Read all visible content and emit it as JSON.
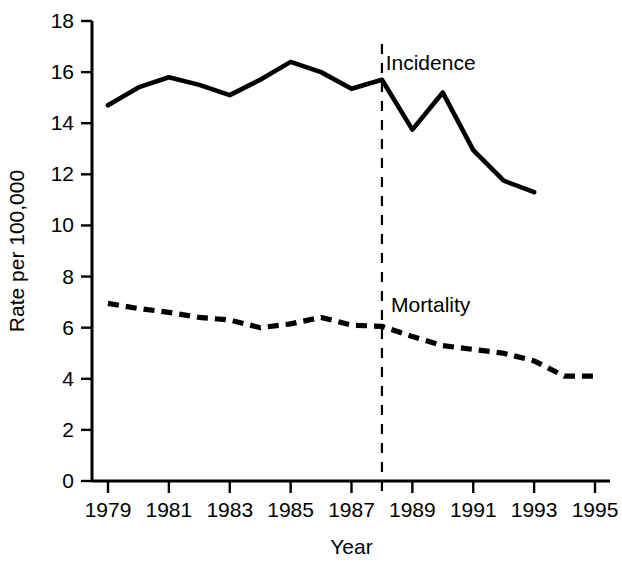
{
  "chart_data": {
    "type": "line",
    "title": "",
    "xlabel": "Year",
    "ylabel": "Rate per 100,000",
    "xlim": [
      1978.4,
      1995.6
    ],
    "ylim": [
      0,
      18
    ],
    "grid": false,
    "legend": "inline-annotations",
    "x_ticks": [
      1979,
      1981,
      1983,
      1985,
      1987,
      1989,
      1991,
      1993,
      1995
    ],
    "x_tick_labels": [
      "1979",
      "1981",
      "1983",
      "1985",
      "1987",
      "1989",
      "1991",
      "1993",
      "1995"
    ],
    "y_ticks": [
      0,
      2,
      4,
      6,
      8,
      10,
      12,
      14,
      16,
      18
    ],
    "y_tick_labels": [
      "0",
      "2",
      "4",
      "6",
      "8",
      "10",
      "12",
      "14",
      "16",
      "18"
    ],
    "annotations": [
      {
        "name": "incidence-label",
        "text": "Incidence",
        "x": 1989.6,
        "y": 16.1
      },
      {
        "name": "mortality-label",
        "text": "Mortality",
        "x": 1989.6,
        "y": 6.6
      },
      {
        "name": "intervention-marker",
        "text": "",
        "x": 1988,
        "style": "vertical-dashed"
      }
    ],
    "series": [
      {
        "name": "Incidence",
        "style": "solid",
        "x": [
          1979,
          1980,
          1981,
          1982,
          1983,
          1984,
          1985,
          1986,
          1987,
          1988,
          1989,
          1990,
          1991,
          1992,
          1993
        ],
        "values": [
          14.7,
          15.4,
          15.8,
          15.5,
          15.1,
          15.7,
          16.4,
          16.0,
          15.35,
          15.7,
          13.75,
          15.2,
          12.95,
          11.75,
          11.3
        ]
      },
      {
        "name": "Mortality",
        "style": "dashed",
        "x": [
          1979,
          1980,
          1981,
          1982,
          1983,
          1984,
          1985,
          1986,
          1987,
          1988,
          1989,
          1990,
          1991,
          1992,
          1993,
          1994,
          1995
        ],
        "values": [
          6.95,
          6.75,
          6.6,
          6.4,
          6.3,
          6.0,
          6.15,
          6.4,
          6.1,
          6.05,
          5.65,
          5.3,
          5.15,
          5.0,
          4.7,
          4.1,
          4.1
        ]
      }
    ]
  }
}
